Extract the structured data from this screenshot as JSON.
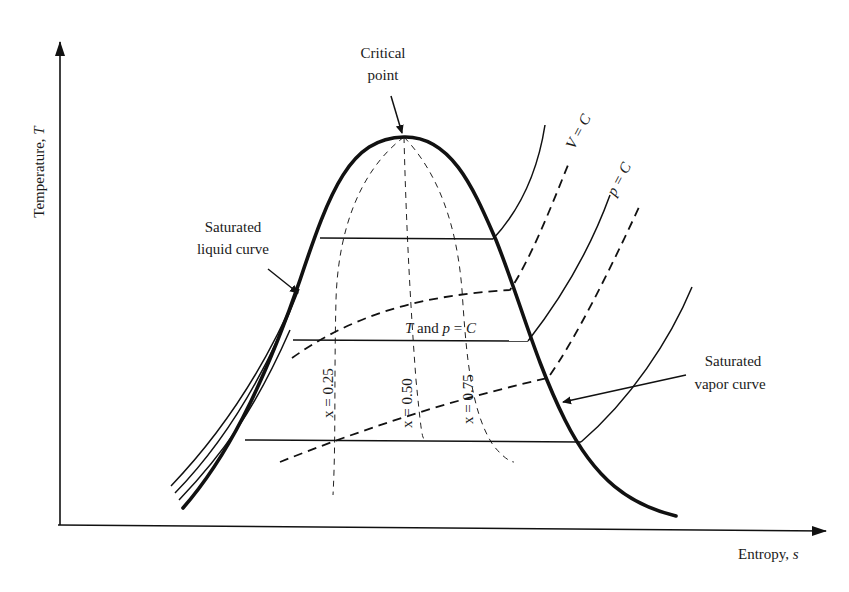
{
  "figure": {
    "type": "T-s diagram",
    "axes": {
      "y_label": "Temperature, ",
      "y_symbol": "T",
      "x_label": "Entropy, ",
      "x_symbol": "s"
    },
    "annotations": {
      "critical_point": [
        "Critical",
        "point"
      ],
      "saturated_liquid": [
        "Saturated",
        "liquid curve"
      ],
      "saturated_vapor": [
        "Saturated",
        "vapor curve"
      ],
      "t_and_p_const": {
        "sym1": "T",
        "mid": " and ",
        "sym2": "p",
        "eq": " = ",
        "sym3": "C"
      },
      "v_const": "V = C",
      "p_const": "p = C",
      "quality_lines": [
        "x = 0.25",
        "x = 0.50",
        "x = 0.75"
      ]
    },
    "colors": {
      "ink": "#111111",
      "background": "#ffffff"
    }
  }
}
